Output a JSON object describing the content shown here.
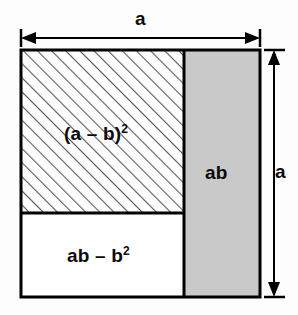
{
  "diagram": {
    "kind": "geometric-algebra-square",
    "title_text": "",
    "outer_square": {
      "x": 21,
      "y": 50,
      "width": 239,
      "height": 247,
      "stroke": "#000000",
      "stroke_width": 3,
      "fill": "#ffffff"
    },
    "regions": [
      {
        "id": "square-of-difference",
        "label": "(a – b)",
        "exponent": "2",
        "fill_style": "diagonal-hatch",
        "fill_color": "#ffffff",
        "hatch_color": "#555555",
        "x": 21,
        "y": 50,
        "width": 163,
        "height": 163
      },
      {
        "id": "ab-rectangle",
        "label": "ab",
        "exponent": "",
        "fill_style": "solid-gray",
        "fill_color": "#c9c9c9",
        "hatch_color": "",
        "x": 184,
        "y": 50,
        "width": 76,
        "height": 247
      },
      {
        "id": "ab-minus-b-squared",
        "label": "ab – b",
        "exponent": "2",
        "fill_style": "solid-white",
        "fill_color": "#ffffff",
        "hatch_color": "",
        "x": 21,
        "y": 213,
        "width": 163,
        "height": 84
      }
    ],
    "dimensions": [
      {
        "id": "width-dimension",
        "label": "a",
        "orientation": "horizontal",
        "from": 21,
        "to": 260,
        "axis_pos": 38
      },
      {
        "id": "height-dimension",
        "label": "a",
        "orientation": "vertical",
        "from": 50,
        "to": 297,
        "axis_pos": 274
      }
    ],
    "colors": {
      "background": "#fdfdfd",
      "line": "#000000",
      "gray_fill": "#c9c9c9",
      "hatch": "#555555",
      "text": "#0a0a0a"
    }
  }
}
